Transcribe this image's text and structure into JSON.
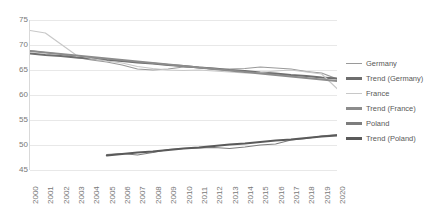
{
  "chart_data": {
    "type": "line",
    "title": "",
    "xlabel": "",
    "ylabel": "",
    "ylim": [
      45,
      75
    ],
    "yticks": [
      75,
      70,
      65,
      60,
      55,
      50,
      45
    ],
    "grid": true,
    "legend_position": "right",
    "x": [
      2000,
      2001,
      2002,
      2003,
      2004,
      2005,
      2006,
      2007,
      2008,
      2009,
      2010,
      2011,
      2012,
      2013,
      2014,
      2015,
      2016,
      2017,
      2018,
      2019,
      2020
    ],
    "series": [
      {
        "name": "Germany",
        "color": "#9a9a9a",
        "kind": "data",
        "values": [
          68.9,
          68.5,
          68.2,
          67.5,
          67.0,
          66.6,
          66.0,
          65.2,
          65.0,
          65.2,
          65.6,
          65.5,
          65.1,
          65.2,
          65.3,
          65.6,
          65.4,
          65.2,
          64.7,
          64.4,
          63.2
        ]
      },
      {
        "name": "Trend (Germany)",
        "color": "#6e6e6e",
        "kind": "trend",
        "values": [
          68.3,
          68.0,
          67.8,
          67.5,
          67.3,
          67.0,
          66.8,
          66.5,
          66.3,
          66.0,
          65.8,
          65.5,
          65.3,
          65.0,
          64.8,
          64.5,
          64.3,
          64.0,
          63.8,
          63.5,
          63.3
        ]
      },
      {
        "name": "France",
        "color": "#c8c8c8",
        "kind": "data",
        "values": [
          72.9,
          72.4,
          70.2,
          68.0,
          67.3,
          66.8,
          66.4,
          65.7,
          65.3,
          65.0,
          64.9,
          65.0,
          64.8,
          64.6,
          64.4,
          64.5,
          64.8,
          65.0,
          64.6,
          64.2,
          61.3
        ]
      },
      {
        "name": "Trend (France)",
        "color": "#8c8c8c",
        "kind": "trend",
        "values": [
          68.8,
          68.5,
          68.2,
          67.9,
          67.6,
          67.3,
          67.0,
          66.7,
          66.4,
          66.1,
          65.8,
          65.5,
          65.2,
          64.9,
          64.6,
          64.3,
          64.0,
          63.7,
          63.4,
          63.1,
          62.8
        ]
      },
      {
        "name": "Poland",
        "color": "#7d7d7d",
        "kind": "data",
        "values": [
          null,
          null,
          null,
          null,
          null,
          48.1,
          48.3,
          48.0,
          48.5,
          49.1,
          49.3,
          49.4,
          49.5,
          49.3,
          49.6,
          50.0,
          50.2,
          51.0,
          51.3,
          51.8,
          52.1
        ]
      },
      {
        "name": "Trend (Poland)",
        "color": "#5a5a5a",
        "kind": "trend",
        "values": [
          null,
          null,
          null,
          null,
          null,
          47.9,
          48.2,
          48.5,
          48.7,
          49.0,
          49.3,
          49.5,
          49.8,
          50.1,
          50.3,
          50.6,
          50.9,
          51.1,
          51.4,
          51.7,
          51.9
        ]
      }
    ]
  },
  "legend": {
    "items": [
      {
        "label": "Germany",
        "color": "#9a9a9a",
        "thickness": 1.4
      },
      {
        "label": "Trend (Germany)",
        "color": "#6e6e6e",
        "thickness": 2.4
      },
      {
        "label": "France",
        "color": "#c8c8c8",
        "thickness": 1.4
      },
      {
        "label": "Trend (France)",
        "color": "#8c8c8c",
        "thickness": 2.4
      },
      {
        "label": "Poland",
        "color": "#7d7d7d",
        "thickness": 2.2
      },
      {
        "label": "Trend (Poland)",
        "color": "#5a5a5a",
        "thickness": 2.4
      }
    ]
  }
}
